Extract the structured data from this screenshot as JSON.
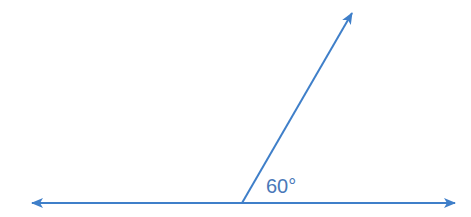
{
  "diagram": {
    "type": "angle",
    "angle_label": "60°",
    "angle_degrees": 60,
    "line_color": "#3f7fc9",
    "label_color": "#4a78b8",
    "horizontal_line": {
      "x1": 30,
      "y": 203,
      "x2": 456,
      "arrows": "both"
    },
    "ray": {
      "vertex": [
        242,
        203
      ],
      "end": [
        353,
        12
      ],
      "arrow": "end"
    }
  }
}
